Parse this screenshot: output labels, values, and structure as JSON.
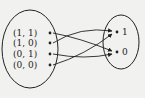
{
  "diagram": {
    "type": "function-mapping",
    "domain_set": {
      "elements": [
        {
          "label": "(1, 1)",
          "y": 33
        },
        {
          "label": "(1, 0)",
          "y": 43
        },
        {
          "label": "(0, 1)",
          "y": 54
        },
        {
          "label": "(0, 0)",
          "y": 65
        }
      ]
    },
    "codomain_set": {
      "elements": [
        {
          "label": "1",
          "y": 32
        },
        {
          "label": "0",
          "y": 52
        }
      ]
    },
    "mappings": [
      {
        "from": "(1, 1)",
        "to": "0"
      },
      {
        "from": "(1, 0)",
        "to": "1"
      },
      {
        "from": "(0, 1)",
        "to": "0"
      },
      {
        "from": "(0, 0)",
        "to": "1"
      }
    ],
    "colors": {
      "ink": "#222222",
      "background": "#f1f1ef"
    }
  }
}
